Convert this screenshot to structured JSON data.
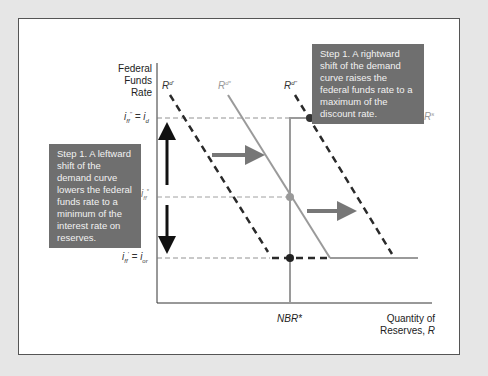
{
  "diagram": {
    "y_axis_label": [
      "Federal",
      "Funds Rate"
    ],
    "x_axis_label": [
      "Quantity of",
      "Reserves, R"
    ],
    "x_tick": "NBR*",
    "y_ticks": [
      {
        "label": "i''ff = id",
        "y": 118
      },
      {
        "label": "i*ff",
        "y": 197
      },
      {
        "label": "i'ff = ior",
        "y": 258
      }
    ],
    "curves": [
      {
        "name": "Rd'",
        "style": "dashed",
        "color": "#2a2a2a"
      },
      {
        "name": "Rd*",
        "style": "solid",
        "color": "#9a9a9a"
      },
      {
        "name": "Rd''",
        "style": "dashed",
        "color": "#2a2a2a"
      },
      {
        "name": "Rs",
        "style": "solid",
        "color": "#9a9a9a"
      }
    ],
    "callouts": {
      "left": "Step 1. A leftward shift of the demand curve lowers the federal funds rate to a minimum of the interest rate on reserves.",
      "right": "Step 1. A rightward shift of the demand curve raises the federal funds rate to a maximum of the discount rate."
    },
    "colors": {
      "callout_bg": "#6f6f6f",
      "supply": "#9a9a9a",
      "demand_dashed": "#2a2a2a",
      "background": "#e6e6e6"
    }
  }
}
